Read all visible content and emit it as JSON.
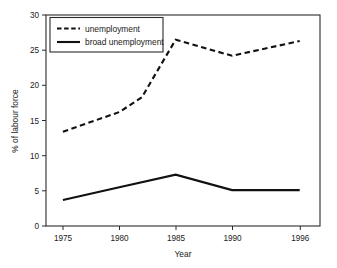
{
  "chart_data": {
    "type": "line",
    "title": "",
    "xlabel": "Year",
    "ylabel": "% of labour force",
    "x": [
      1975,
      1980,
      1982,
      1985,
      1990,
      1996
    ],
    "xlim": [
      1973.5,
      1997.8
    ],
    "ylim": [
      0,
      30
    ],
    "xticks": [
      1975,
      1980,
      1985,
      1990,
      1996
    ],
    "xtick_labels": [
      "1975",
      "1980",
      "1985",
      "1990",
      "1996"
    ],
    "yticks": [
      0,
      5,
      10,
      15,
      20,
      25,
      30
    ],
    "ytick_labels": [
      "0",
      "5",
      "10",
      "15",
      "20",
      "25",
      "30"
    ],
    "grid": false,
    "legend_position": "upper-left",
    "series": [
      {
        "name": "unemployment",
        "style": "dashed",
        "color": "#111111",
        "x": [
          1975,
          1980,
          1982,
          1985,
          1990,
          1996
        ],
        "values": [
          13.4,
          16.2,
          18.3,
          26.5,
          24.2,
          26.3
        ]
      },
      {
        "name": "broad unemployment",
        "style": "solid",
        "color": "#111111",
        "x": [
          1975,
          1980,
          1985,
          1990,
          1996
        ],
        "values": [
          3.7,
          5.5,
          7.3,
          5.1,
          5.1
        ]
      }
    ]
  },
  "axes": {
    "x_title": "Year",
    "y_title": "% of labour force",
    "x_tick_labels": [
      "1975",
      "1980",
      "1985",
      "1990",
      "1996"
    ],
    "y_tick_labels": [
      "0",
      "5",
      "10",
      "15",
      "20",
      "25",
      "30"
    ]
  },
  "legend": {
    "entries": [
      {
        "label": "unemployment",
        "style": "dashed"
      },
      {
        "label": "broad unemployment",
        "style": "solid"
      }
    ]
  },
  "colors": {
    "background": "#ffffff",
    "ink": "#111111",
    "frame": "#2b2b2b"
  }
}
